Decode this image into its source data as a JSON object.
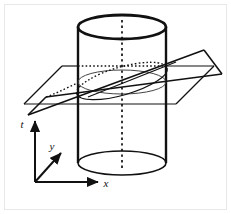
{
  "figure": {
    "canvas": {
      "width": 231,
      "height": 214,
      "background": "#ffffff"
    },
    "border": {
      "color": "#e8e8e8",
      "width": 1
    },
    "stroke_color": "#111111",
    "axes": {
      "origin": {
        "x": 35,
        "y": 182
      },
      "items": [
        {
          "name": "t",
          "label": "t",
          "direction": "up",
          "tip": {
            "x": 35,
            "y": 118
          },
          "label_pos": {
            "x": 23,
            "y": 127
          }
        },
        {
          "name": "y",
          "label": "y",
          "direction": "up-right-diagonal",
          "tip": {
            "x": 64,
            "y": 150
          },
          "label_pos": {
            "x": 52,
            "y": 149
          }
        },
        {
          "name": "x",
          "label": "x",
          "direction": "right",
          "tip": {
            "x": 101,
            "y": 182
          },
          "label_pos": {
            "x": 104,
            "y": 187
          }
        }
      ]
    },
    "cylinder": {
      "name": "vertical-cylinder",
      "center_x": 122,
      "radius_x": 44,
      "radius_y": 12,
      "top_y": 27,
      "bottom_y": 163,
      "top_rim_stroke_width": 2.6,
      "bottom_rim_stroke_width": 1.5,
      "wall_stroke_width": 2.4,
      "left_wall_x": 78,
      "right_wall_x": 166,
      "axis_line": {
        "dashed": true,
        "from_y": 22,
        "to_y": 168
      }
    },
    "horizontal_plane": {
      "name": "horizontal-plane",
      "corners": [
        {
          "x": 62,
          "y": 66
        },
        {
          "x": 214,
          "y": 66
        },
        {
          "x": 176,
          "y": 104
        },
        {
          "x": 24,
          "y": 104
        }
      ],
      "hidden_edge_dashed": true,
      "stroke_width": 1.1
    },
    "tilted_plane": {
      "name": "tilted-cutting-plane",
      "corners": [
        {
          "x": 28,
          "y": 115
        },
        {
          "x": 204,
          "y": 50
        },
        {
          "x": 222,
          "y": 74
        },
        {
          "x": 46,
          "y": 97
        }
      ],
      "stroke_width": 1.5
    },
    "cross_section_ellipse": {
      "name": "horizontal-cross-section-ellipse",
      "center": {
        "x": 122,
        "y": 82
      },
      "radius_x": 44,
      "radius_y": 12,
      "stroke_width": 1.0
    },
    "intersection_ellipse": {
      "name": "tilted-intersection-ellipse",
      "center": {
        "x": 122,
        "y": 81
      },
      "radius_x": 47,
      "radius_y": 14,
      "rotation_deg": -16,
      "stroke_width": 1.1,
      "back_half_dashed": true
    }
  }
}
